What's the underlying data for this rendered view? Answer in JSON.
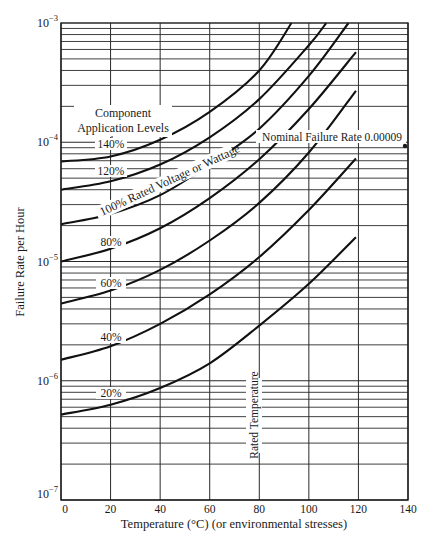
{
  "chart_data": {
    "type": "line",
    "title": "",
    "xlabel": "Temperature (°C) (or environmental stresses)",
    "ylabel": "Failure Rate per Hour",
    "xlim": [
      0,
      140
    ],
    "ylim": [
      1e-07,
      0.001
    ],
    "yscale": "log",
    "grid": true,
    "x_ticks": [
      0,
      20,
      40,
      60,
      80,
      100,
      120,
      140
    ],
    "x_tick_labels": [
      "0",
      "20",
      "40",
      "60",
      "80",
      "100",
      "120",
      "140"
    ],
    "y_ticks": [
      1e-07,
      1e-06,
      1e-05,
      0.0001,
      0.001
    ],
    "y_tick_labels": [
      {
        "base": "10",
        "exp": "−7"
      },
      {
        "base": "10",
        "exp": "−6"
      },
      {
        "base": "10",
        "exp": "−5"
      },
      {
        "base": "10",
        "exp": "−4"
      },
      {
        "base": "10",
        "exp": "−3"
      }
    ],
    "legend_title": [
      "Component",
      "Application Levels"
    ],
    "series": [
      {
        "name": "140%",
        "x": [
          0,
          20,
          40,
          60,
          80,
          93
        ],
        "values": [
          6.9e-05,
          7.6e-05,
          0.000105,
          0.00018,
          0.0004,
          0.001
        ]
      },
      {
        "name": "120%",
        "x": [
          0,
          20,
          40,
          60,
          80,
          100,
          107
        ],
        "values": [
          4e-05,
          4.7e-05,
          6.5e-05,
          0.00011,
          0.00023,
          0.00065,
          0.001
        ]
      },
      {
        "name": "100% Rated Voltage or Wattage",
        "x": [
          0,
          20,
          40,
          60,
          80,
          100,
          116
        ],
        "values": [
          2.05e-05,
          2.5e-05,
          3.6e-05,
          6.5e-05,
          0.00013,
          0.00036,
          0.001
        ]
      },
      {
        "name": "80%",
        "x": [
          0,
          20,
          40,
          60,
          80,
          100,
          119
        ],
        "values": [
          1e-05,
          1.28e-05,
          1.9e-05,
          3.4e-05,
          7.2e-05,
          0.00019,
          0.00057
        ]
      },
      {
        "name": "60%",
        "x": [
          0,
          20,
          40,
          60,
          80,
          100,
          119
        ],
        "values": [
          4.45e-06,
          5.7e-06,
          8.5e-06,
          1.5e-05,
          3.1e-05,
          8.2e-05,
          0.00027
        ]
      },
      {
        "name": "40%",
        "x": [
          0,
          20,
          40,
          60,
          80,
          100,
          119
        ],
        "values": [
          1.5e-06,
          1.95e-06,
          3e-06,
          5.3e-06,
          1.09e-05,
          2.7e-05,
          7.3e-05
        ]
      },
      {
        "name": "20%",
        "x": [
          0,
          20,
          40,
          60,
          80,
          100,
          119
        ],
        "values": [
          5.2e-07,
          6.3e-07,
          8.7e-07,
          1.4e-06,
          2.9e-06,
          6.5e-06,
          1.6e-05
        ]
      }
    ],
    "annotations": [
      {
        "text": "Nominal Failure Rate 0.00009",
        "x": 140,
        "y": 9e-05
      },
      {
        "text": "Rated Temperature",
        "x": 80,
        "orientation": "vertical"
      }
    ],
    "curve_labels": [
      "140%",
      "120%",
      "100% Rated Voltage or Wattage",
      "80%",
      "60%",
      "40%",
      "20%"
    ]
  }
}
